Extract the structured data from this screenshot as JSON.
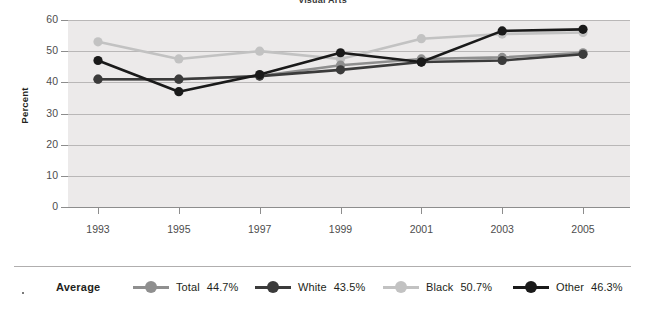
{
  "chart_data": {
    "type": "line",
    "title": "Visual Arts",
    "xlabel": "",
    "ylabel": "Percent",
    "x": [
      1993,
      1995,
      1997,
      1999,
      2001,
      2003,
      2005
    ],
    "xticklabels": [
      "1993",
      "1995",
      "1997",
      "1999",
      "2001",
      "2003",
      "2005"
    ],
    "yticklabels": [
      "0",
      "10",
      "20",
      "30",
      "40",
      "50",
      "60"
    ],
    "yticks": [
      0,
      10,
      20,
      30,
      40,
      50,
      60
    ],
    "ylim": [
      0,
      60
    ],
    "grid": true,
    "legend_position": "bottom",
    "legend_title": "Average",
    "series": [
      {
        "name": "Total",
        "average": "44.7%",
        "color": "#8f8f8f",
        "values": [
          41.0,
          41.0,
          42.0,
          45.5,
          47.5,
          48.0,
          49.5
        ]
      },
      {
        "name": "White",
        "average": "43.5%",
        "color": "#3b3b3b",
        "values": [
          41.0,
          41.0,
          42.0,
          44.0,
          46.5,
          47.0,
          49.0
        ]
      },
      {
        "name": "Black",
        "average": "50.7%",
        "color": "#c2c2c2",
        "values": [
          53.0,
          47.5,
          50.0,
          47.5,
          54.0,
          55.5,
          56.0
        ]
      },
      {
        "name": "Other",
        "average": "46.3%",
        "color": "#1a1a1a",
        "values": [
          47.0,
          37.0,
          42.5,
          49.5,
          46.5,
          56.5,
          57.0
        ]
      }
    ]
  },
  "legend": {
    "title": "Average",
    "entries": [
      {
        "label": "Total",
        "value": "44.7%"
      },
      {
        "label": "White",
        "value": "43.5%"
      },
      {
        "label": "Black",
        "value": "50.7%"
      },
      {
        "label": "Other",
        "value": "46.3%"
      }
    ]
  },
  "axes": {
    "y_title": "Percent"
  }
}
